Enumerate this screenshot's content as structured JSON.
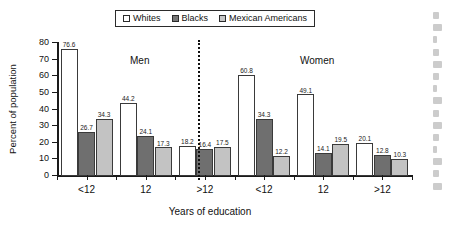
{
  "chart_data": {
    "type": "bar",
    "title": "",
    "xlabel": "Years of education",
    "ylabel": "Percent of population",
    "ylim": [
      0,
      80
    ],
    "yticks": [
      0,
      10,
      20,
      30,
      40,
      50,
      60,
      70,
      80
    ],
    "grid": false,
    "legend_position": "top-center",
    "categories": [
      "<12",
      "12",
      ">12",
      "<12",
      "12",
      ">12"
    ],
    "group_labels": [
      "Men",
      "Women"
    ],
    "group_split_after_category_index": 2,
    "series": [
      {
        "name": "Whites",
        "color": "#ffffff",
        "values": [
          76.6,
          44.2,
          18.2,
          60.8,
          49.1,
          20.1
        ]
      },
      {
        "name": "Blacks",
        "color": "#6f6f6f",
        "values": [
          26.7,
          24.1,
          16.4,
          34.3,
          14.1,
          12.8
        ]
      },
      {
        "name": "Mexican Americans",
        "color": "#c3c3c3",
        "values": [
          34.3,
          17.3,
          17.5,
          12.2,
          19.5,
          10.3
        ]
      }
    ]
  },
  "legend": {
    "items": [
      {
        "label": "Whites"
      },
      {
        "label": "Blacks"
      },
      {
        "label": "Mexican Americans"
      }
    ]
  },
  "axes": {
    "y_title": "Percent of population",
    "x_title": "Years of education",
    "y_tick_labels": [
      "80",
      "70",
      "60",
      "50",
      "40",
      "30",
      "20",
      "10",
      "0"
    ],
    "x_tick_labels": [
      "<12",
      "12",
      ">12",
      "<12",
      "12",
      ">12"
    ]
  },
  "annotations": {
    "men": "Men",
    "women": "Women"
  },
  "bar_value_labels": [
    "76.6",
    "26.7",
    "34.3",
    "44.2",
    "24.1",
    "17.3",
    "18.2",
    "16.4",
    "17.5",
    "60.8",
    "34.3",
    "12.2",
    "49.1",
    "14.1",
    "19.5",
    "20.1",
    "12.8",
    "10.3"
  ]
}
